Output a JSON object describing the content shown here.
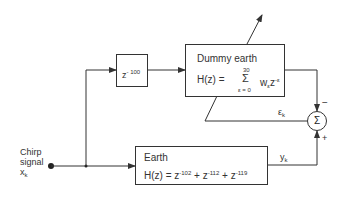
{
  "diagram": {
    "input": {
      "label_line1": "Chirp",
      "label_line2": "signal",
      "symbol": "x",
      "symbol_sub": "k"
    },
    "delay_block": {
      "base": "z",
      "exponent": "- 100"
    },
    "dummy_earth": {
      "title": "Dummy earth",
      "lhs": "H(z) =",
      "sigma": "Σ",
      "upper_limit": "30",
      "lower_limit": "ε = 0",
      "term_base": "w",
      "term_sub": "ε",
      "term_z": "z",
      "term_exp": "-ε"
    },
    "earth": {
      "title": "Earth",
      "lhs": "H(z) = z",
      "exp1": "-102",
      "plus1": " + z",
      "exp2": "-112",
      "plus2": " + z",
      "exp3": "-119"
    },
    "summer": {
      "symbol": "Σ",
      "minus_sign": "−",
      "plus_sign": "+"
    },
    "signals": {
      "error": "ε",
      "error_sub": "k",
      "output": "y",
      "output_sub": "k"
    },
    "colors": {
      "line": "#333333",
      "background": "#ffffff"
    }
  }
}
